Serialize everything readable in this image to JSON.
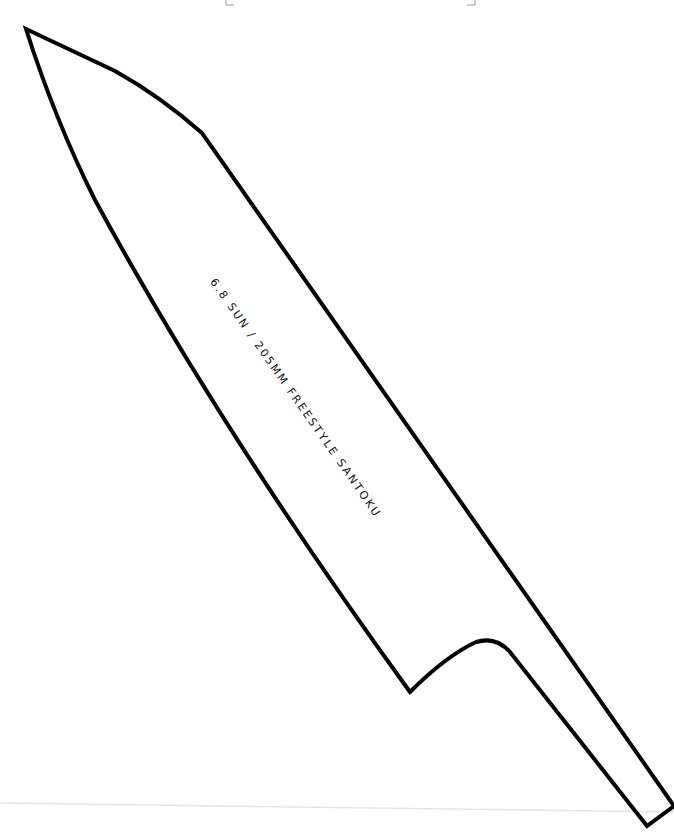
{
  "template": {
    "title": "6.8 SUN / 205MM FREESTYLE SANTOKU",
    "outline_color": "#000000",
    "crop_mark_color": "#9a9a9a",
    "background": "#ffffff"
  }
}
